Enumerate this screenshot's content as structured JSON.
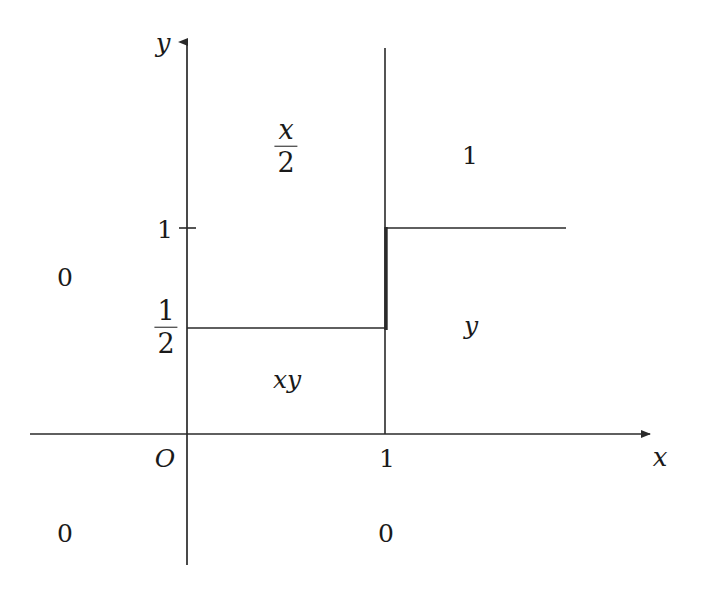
{
  "figure": {
    "type": "piecewise-cdf-region-diagram",
    "background_color": "#ffffff",
    "line_color": "#2a2a2a",
    "width": 705,
    "height": 592
  },
  "axes": {
    "x_axis": {
      "label": "x",
      "label_x": 660,
      "label_y": 457,
      "start_x": 30,
      "end_x": 657,
      "y": 434,
      "arrow": "right"
    },
    "y_axis": {
      "label": "y",
      "label_x": 163,
      "label_y": 43,
      "x": 187,
      "start_y": 565,
      "end_y": 35,
      "arrow": "up"
    },
    "origin_label": "O",
    "origin_label_x": 165,
    "origin_label_y": 458
  },
  "ticks": [
    {
      "name": "y-tick-one",
      "axis": "y",
      "label": "1",
      "value": 1,
      "pixel_x": 187,
      "pixel_y": 228,
      "label_x": 165,
      "label_y": 229,
      "has_mark": true
    },
    {
      "name": "y-tick-half",
      "axis": "y",
      "label": "1/2",
      "numerator": "1",
      "denominator": "2",
      "value": 0.5,
      "pixel_x": 187,
      "pixel_y": 328,
      "label_x": 166,
      "label_y": 327,
      "has_mark": false
    },
    {
      "name": "x-tick-one",
      "axis": "x",
      "label": "1",
      "value": 1,
      "pixel_x": 385,
      "pixel_y": 434,
      "label_x": 387,
      "label_y": 458,
      "has_mark": false
    }
  ],
  "boundary_lines": [
    {
      "name": "vertical-line-x-equals-1",
      "x1": 385,
      "y1": 48,
      "x2": 385,
      "y2": 434,
      "width": 1.6
    },
    {
      "name": "horizontal-line-y-equals-half",
      "x1": 187,
      "y1": 328,
      "x2": 386,
      "y2": 328,
      "width": 1.6
    },
    {
      "name": "horizontal-line-y-equals-1-right",
      "x1": 385,
      "y1": 228,
      "x2": 566,
      "y2": 228,
      "width": 1.6
    },
    {
      "name": "bold-vertical-segment",
      "x1": 386,
      "y1": 228,
      "x2": 386,
      "y2": 330,
      "width": 3.4
    }
  ],
  "region_labels": [
    {
      "name": "region-label-x-over-2",
      "kind": "fraction",
      "numerator": "x",
      "denominator": "2",
      "numerator_style": "italic",
      "denominator_style": "upright",
      "x": 286,
      "y": 146,
      "font_size": 27
    },
    {
      "name": "region-label-one-upper-right",
      "kind": "text",
      "text": "1",
      "style": "upright",
      "x": 470,
      "y": 155,
      "font_size": 25
    },
    {
      "name": "region-label-zero-left",
      "kind": "text",
      "text": "0",
      "style": "upright",
      "x": 65,
      "y": 277,
      "font_size": 25
    },
    {
      "name": "region-label-xy",
      "kind": "text",
      "text": "xy",
      "style": "italic",
      "x": 287,
      "y": 379,
      "font_size": 25
    },
    {
      "name": "region-label-y-right",
      "kind": "text",
      "text": "y",
      "style": "italic",
      "x": 471,
      "y": 325,
      "font_size": 25
    },
    {
      "name": "region-label-zero-lower-left",
      "kind": "text",
      "text": "0",
      "style": "upright",
      "x": 65,
      "y": 533,
      "font_size": 25
    },
    {
      "name": "region-label-zero-lower-right",
      "kind": "text",
      "text": "0",
      "style": "upright",
      "x": 386,
      "y": 533,
      "font_size": 25
    }
  ]
}
